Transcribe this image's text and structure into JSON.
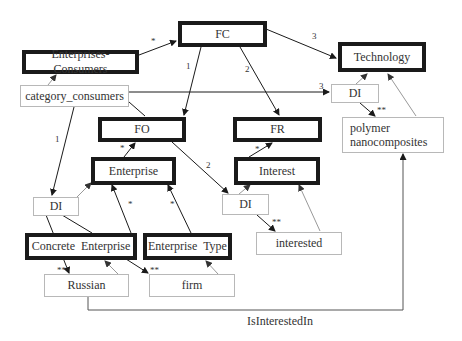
{
  "diagram": {
    "nodes": {
      "fc": "FC",
      "enterprises_consumers": "Enterprises-Consumers",
      "technology": "Technology",
      "category_consumers": "category_consumers",
      "di_tech": "DI",
      "polymer": "polymer nanocomposites",
      "fo": "FO",
      "fr": "FR",
      "enterprise": "Enterprise",
      "interest": "Interest",
      "di_enterprise": "DI",
      "di_interest": "DI",
      "concrete_enterprise": "Concrete  Enterprise",
      "enterprise_type": "Enterprise  Type",
      "interested": "interested",
      "russian": "Russian",
      "firm": "firm"
    },
    "edge_labels": {
      "ec_fc": "*",
      "fc_fo": "1",
      "fc_fr": "2",
      "fc_tech": "3",
      "cat_di_tech": "3",
      "cat_di_ent": "1",
      "fo_di_int": "2",
      "ent_fo": "*",
      "int_fr": "*",
      "ce_ent": "*",
      "et_ent": "*",
      "di_tech_poly": "**",
      "di_int_interested": "**",
      "di_ent_russian": "**",
      "ce_firm": "**"
    },
    "relation_caption": "IsInterestedIn"
  }
}
